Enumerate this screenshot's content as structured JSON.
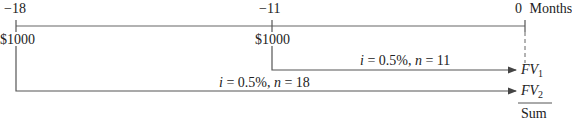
{
  "timeline": {
    "unit_label": "Months",
    "ticks": [
      {
        "label": "−18",
        "cashflow": "$1000"
      },
      {
        "label": "−11",
        "cashflow": "$1000"
      },
      {
        "label": "0"
      }
    ]
  },
  "arrows": [
    {
      "i_label": "i",
      "eq1": " = 0.5%, ",
      "n_label": "n",
      "eq2": " = 11",
      "target_main": "FV",
      "target_sub": "1"
    },
    {
      "i_label": "i",
      "eq1": " = 0.5%, ",
      "n_label": "n",
      "eq2": " = 18",
      "target_main": "FV",
      "target_sub": "2"
    }
  ],
  "sum_label": "Sum",
  "colors": {
    "line": "#555555",
    "text": "#222222"
  }
}
